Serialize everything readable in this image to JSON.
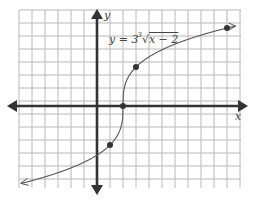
{
  "chart_data": {
    "type": "line",
    "title": "",
    "equation_label": "y = 3∛(x − 2)",
    "xlabel": "x",
    "ylabel": "y",
    "grid": true,
    "xlim": [
      -6,
      11
    ],
    "ylim": [
      -2.67,
      3.17
    ],
    "x_unit_per_gridline": 1,
    "y_unit_per_gridline": 0.3333,
    "points": [
      {
        "x": 1,
        "y": -1
      },
      {
        "x": 2,
        "y": 0
      },
      {
        "x": 3,
        "y": 1
      },
      {
        "x": 10,
        "y": 2
      }
    ],
    "series": [
      {
        "name": "y = 3∛(x − 2)",
        "function": "cbrt(x-2)",
        "x_range": [
          -4.5,
          10.5
        ],
        "arrows": "both"
      }
    ]
  },
  "labels": {
    "equation": "y = 3∛x − 2",
    "x_axis": "x",
    "y_axis": "y"
  }
}
